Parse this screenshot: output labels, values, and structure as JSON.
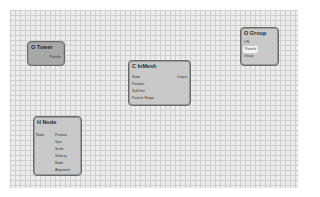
{
  "canvas": {
    "grid": true
  },
  "nodes": {
    "tower": {
      "title": "O Tower",
      "outputs": [
        "Particle"
      ]
    },
    "group": {
      "title": "O Group",
      "inputs": [
        "ON",
        "Particle",
        "Group"
      ],
      "highlighted": "Particle"
    },
    "inmesh": {
      "title": "C InMesh",
      "inputs": [
        "Node",
        "Position",
        "SubTree",
        "Particle Shape"
      ],
      "outputs": [
        "Output"
      ]
    },
    "hnode": {
      "title": "H Node",
      "inputs": [
        "Node"
      ],
      "outputs": [
        "Position",
        "Spin",
        "Scale",
        "Velocity",
        "Node",
        "Alignment"
      ]
    }
  }
}
